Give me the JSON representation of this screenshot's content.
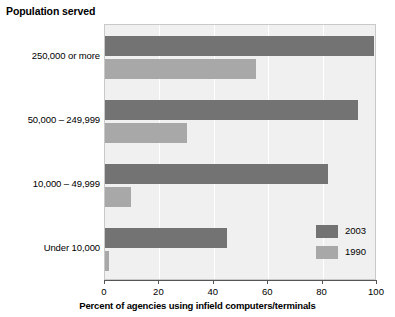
{
  "chart_data": {
    "type": "bar",
    "orientation": "horizontal",
    "title": "Population served",
    "xlabel": "Percent of agencies using infield computers/terminals",
    "ylabel": "Population served",
    "categories": [
      "250,000 or more",
      "50,000 – 249,999",
      "10,000 – 49,999",
      "Under 10,000"
    ],
    "series": [
      {
        "name": "2003",
        "color": "#737373",
        "values": [
          99,
          93,
          82,
          45
        ]
      },
      {
        "name": "1990",
        "color": "#a8a8a8",
        "values": [
          55.5,
          30,
          9.5,
          1.5
        ]
      }
    ],
    "xlim": [
      0,
      100
    ],
    "xticks": [
      0,
      20,
      40,
      60,
      80,
      100
    ],
    "xtick_labels": [
      "0",
      "20",
      "40",
      "60",
      "80",
      "100"
    ],
    "grid": "vertical",
    "legend_position": "bottom-right",
    "plot_background": "#f0f0f0"
  },
  "legend": {
    "entries": [
      {
        "label": "2003"
      },
      {
        "label": "1990"
      }
    ]
  }
}
